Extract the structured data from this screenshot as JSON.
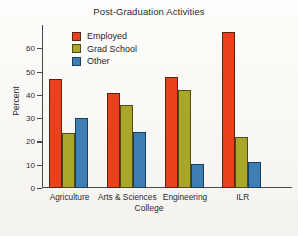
{
  "chart_data": {
    "type": "bar",
    "title": "Post-Graduation Activities",
    "xlabel": "College",
    "ylabel": "Percent",
    "ylim": [
      0,
      70
    ],
    "yticks": [
      0,
      10,
      20,
      30,
      40,
      50,
      60
    ],
    "grid": false,
    "legend_position": "upper-left-inside",
    "categories": [
      "Agriculture",
      "Arts & Sciences",
      "Engineering",
      "ILR"
    ],
    "series": [
      {
        "name": "Employed",
        "color": "#e8411c",
        "values": [
          47,
          41,
          47.5,
          67
        ]
      },
      {
        "name": "Grad School",
        "color": "#a9a62a",
        "values": [
          23.5,
          35.5,
          42,
          22
        ]
      },
      {
        "name": "Other",
        "color": "#3d7fb5",
        "values": [
          30,
          24,
          10.5,
          11
        ]
      }
    ]
  },
  "legend": {
    "items": [
      {
        "label": "Employed"
      },
      {
        "label": "Grad School"
      },
      {
        "label": "Other"
      }
    ]
  }
}
